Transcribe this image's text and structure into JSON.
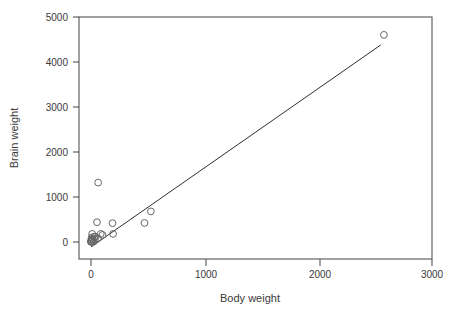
{
  "chart_data": {
    "type": "scatter",
    "title": "",
    "xlabel": "Body weight",
    "ylabel": "Brain weight",
    "xlim": [
      -100,
      3000
    ],
    "ylim": [
      -250,
      5000
    ],
    "xticks": [
      0,
      1000,
      2000,
      3000
    ],
    "xtick_labels": [
      "0",
      "1000",
      "2000",
      "3000"
    ],
    "yticks": [
      0,
      1000,
      2000,
      3000,
      4000,
      5000
    ],
    "ytick_labels": [
      "0",
      "1000",
      "2000",
      "3000",
      "4000",
      "5000"
    ],
    "grid": false,
    "legend": null,
    "marker_style": "open-circle",
    "marker_color": "#666666",
    "line_color": "#2f2f2f",
    "points": [
      {
        "x": 2547,
        "y": 4603
      },
      {
        "x": 62,
        "y": 1320
      },
      {
        "x": 521,
        "y": 680
      },
      {
        "x": 465,
        "y": 423
      },
      {
        "x": 187,
        "y": 419
      },
      {
        "x": 52,
        "y": 440
      },
      {
        "x": 192,
        "y": 180
      },
      {
        "x": 10,
        "y": 180
      },
      {
        "x": 85,
        "y": 180
      },
      {
        "x": 28,
        "y": 115
      },
      {
        "x": 36,
        "y": 120
      },
      {
        "x": 100,
        "y": 157
      },
      {
        "x": 6,
        "y": 98
      },
      {
        "x": 3,
        "y": 55
      },
      {
        "x": 17,
        "y": 50
      },
      {
        "x": 60,
        "y": 81
      },
      {
        "x": 1,
        "y": 11
      },
      {
        "x": 4,
        "y": 25
      },
      {
        "x": 25,
        "y": 12
      },
      {
        "x": 2,
        "y": 5
      },
      {
        "x": 35,
        "y": 56
      },
      {
        "x": 1,
        "y": 3
      },
      {
        "x": 12,
        "y": 70
      },
      {
        "x": 3,
        "y": 12
      }
    ],
    "fit_line": {
      "label": "least-squares fit",
      "x_start": 0,
      "y_start": -110,
      "x_end": 2520,
      "y_end": 4380
    }
  },
  "axes": {
    "x_axis_name": "x-axis",
    "y_axis_name": "y-axis"
  }
}
